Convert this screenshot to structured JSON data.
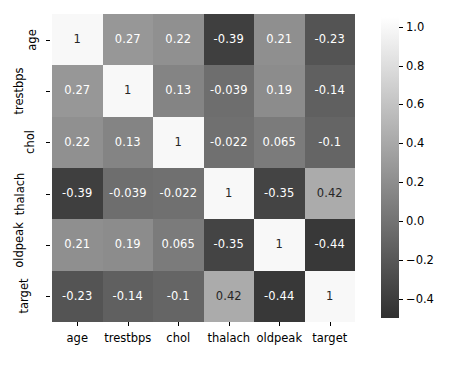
{
  "chart_data": {
    "type": "heatmap",
    "title": "",
    "xlabel": "",
    "ylabel": "",
    "grid": false,
    "legend_position": "right",
    "colormap": "gray",
    "categories": [
      "age",
      "trestbps",
      "chol",
      "thalach",
      "oldpeak",
      "target"
    ],
    "x_tick_labels": [
      "age",
      "trestbps",
      "chol",
      "thalach",
      "oldpeak",
      "target"
    ],
    "y_tick_labels": [
      "age",
      "trestbps",
      "chol",
      "thalach",
      "oldpeak",
      "target"
    ],
    "rows": [
      {
        "name": "age",
        "values": [
          1,
          0.27,
          0.22,
          -0.39,
          0.21,
          -0.23
        ],
        "labels": [
          "1",
          "0.27",
          "0.22",
          "-0.39",
          "0.21",
          "-0.23"
        ]
      },
      {
        "name": "trestbps",
        "values": [
          0.27,
          1,
          0.13,
          -0.039,
          0.19,
          -0.14
        ],
        "labels": [
          "0.27",
          "1",
          "0.13",
          "-0.039",
          "0.19",
          "-0.14"
        ]
      },
      {
        "name": "chol",
        "values": [
          0.22,
          0.13,
          1,
          -0.022,
          0.065,
          -0.1
        ],
        "labels": [
          "0.22",
          "0.13",
          "1",
          "-0.022",
          "0.065",
          "-0.1"
        ]
      },
      {
        "name": "thalach",
        "values": [
          -0.39,
          -0.039,
          -0.022,
          1,
          -0.35,
          0.42
        ],
        "labels": [
          "-0.39",
          "-0.039",
          "-0.022",
          "1",
          "-0.35",
          "0.42"
        ]
      },
      {
        "name": "oldpeak",
        "values": [
          0.21,
          0.19,
          0.065,
          -0.35,
          1,
          -0.44
        ],
        "labels": [
          "0.21",
          "0.19",
          "0.065",
          "-0.35",
          "1",
          "-0.44"
        ]
      },
      {
        "name": "target",
        "values": [
          -0.23,
          -0.14,
          -0.1,
          0.42,
          -0.44,
          1
        ],
        "labels": [
          "-0.23",
          "-0.14",
          "-0.1",
          "0.42",
          "-0.44",
          "1"
        ]
      }
    ],
    "colorbar": {
      "vmin": -0.5,
      "vmax": 1.05,
      "ticks": [
        1.0,
        0.8,
        0.6,
        0.4,
        0.2,
        0.0,
        -0.2,
        -0.4
      ],
      "tick_labels": [
        "1.0",
        "0.8",
        "0.6",
        "0.4",
        "0.2",
        "0.0",
        "−0.2",
        "−0.4"
      ]
    }
  },
  "colors": {
    "background": "#ffffff",
    "axis": "#000000",
    "text_light": "#ffffff",
    "text_dark": "#262626"
  }
}
